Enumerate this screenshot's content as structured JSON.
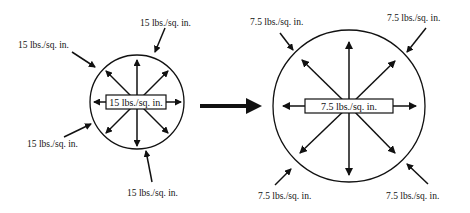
{
  "diagram": {
    "left_state": {
      "internal_pressure": "15 lbs./sq. in.",
      "external_labels": [
        "15 lbs./sq. in.",
        "15 lbs./sq. in.",
        "15 lbs./sq. in.",
        "15 lbs./sq. in."
      ]
    },
    "transition": {
      "arrow": "right-arrow"
    },
    "right_state": {
      "internal_pressure": "7.5 lbs./sq. in.",
      "external_labels": [
        "7.5 lbs./sq. in.",
        "7.5 lbs./sq. in.",
        "7.5 lbs./sq. in.",
        "7.5 lbs./sq. in."
      ]
    },
    "colors": {
      "stroke": "#111111",
      "background": "#ffffff"
    }
  }
}
